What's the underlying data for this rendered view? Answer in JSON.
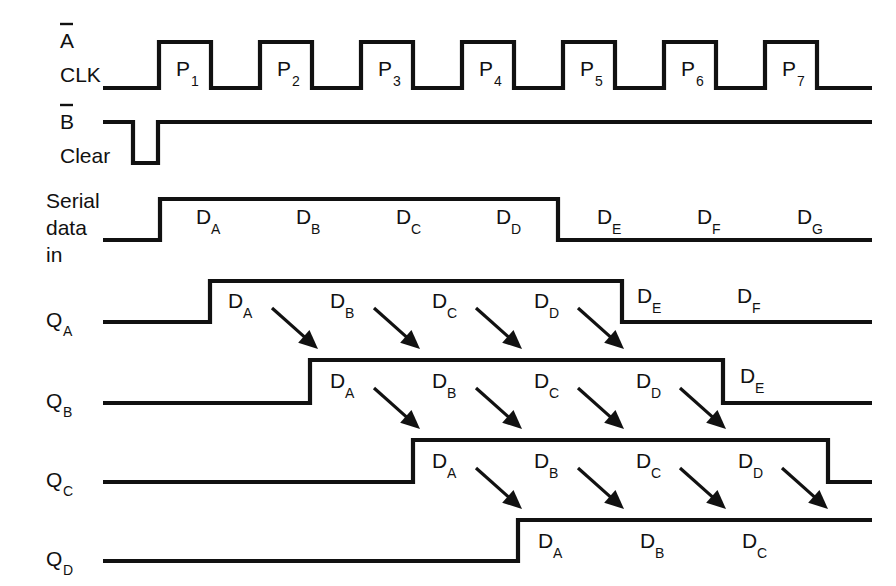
{
  "figure": {
    "type": "timing-diagram",
    "line_color": "#111111",
    "background": "#ffffff",
    "width": 896,
    "height": 586
  },
  "geometry": {
    "clock_first_rise_x": 159,
    "clock_pulse_width": 52,
    "clock_period": 101,
    "wave_start_x": 103,
    "wave_end_x": 872
  },
  "rows": [
    {
      "id": "clk",
      "name": "A CLK",
      "label_lines": [
        "A",
        "CLK"
      ],
      "label_overbar_line": 0,
      "y_high": 42,
      "y_low": 88,
      "kind": "clock",
      "pulses": [
        {
          "label": "P",
          "sub": "1",
          "rise": 159,
          "fall": 211
        },
        {
          "label": "P",
          "sub": "2",
          "rise": 260,
          "fall": 312
        },
        {
          "label": "P",
          "sub": "3",
          "rise": 361,
          "fall": 413
        },
        {
          "label": "P",
          "sub": "4",
          "rise": 462,
          "fall": 514
        },
        {
          "label": "P",
          "sub": "5",
          "rise": 563,
          "fall": 615
        },
        {
          "label": "P",
          "sub": "6",
          "rise": 664,
          "fall": 716
        },
        {
          "label": "P",
          "sub": "7",
          "rise": 765,
          "fall": 817
        }
      ]
    },
    {
      "id": "clear",
      "name": "B Clear",
      "label_lines": [
        "B",
        "Clear"
      ],
      "label_overbar_line": 0,
      "y_high": 122,
      "y_low": 163,
      "kind": "active-low-pulse",
      "low_start": 133,
      "low_end": 158,
      "data_labels": []
    },
    {
      "id": "serial-data-in",
      "name": "Serial data in",
      "label_lines": [
        "Serial",
        "data",
        "in"
      ],
      "label_overbar_line": -1,
      "y_high": 199,
      "y_low": 240,
      "kind": "data",
      "rise": 160,
      "fall": 558,
      "data_labels": [
        {
          "label": "D",
          "sub": "A",
          "x": 196,
          "y": 224
        },
        {
          "label": "D",
          "sub": "B",
          "x": 296,
          "y": 224
        },
        {
          "label": "D",
          "sub": "C",
          "x": 396,
          "y": 224
        },
        {
          "label": "D",
          "sub": "D",
          "x": 496,
          "y": 224
        },
        {
          "label": "D",
          "sub": "E",
          "x": 597,
          "y": 224
        },
        {
          "label": "D",
          "sub": "F",
          "x": 697,
          "y": 224
        },
        {
          "label": "D",
          "sub": "G",
          "x": 797,
          "y": 224
        }
      ]
    },
    {
      "id": "qa",
      "name": "QA",
      "label_lines": [
        "Q"
      ],
      "label_sub": "A",
      "label_overbar_line": -1,
      "y_high": 281,
      "y_low": 322,
      "kind": "data",
      "rise": 210,
      "fall": 622,
      "data_labels": [
        {
          "label": "D",
          "sub": "A",
          "x": 228,
          "y": 308
        },
        {
          "label": "D",
          "sub": "B",
          "x": 330,
          "y": 308
        },
        {
          "label": "D",
          "sub": "C",
          "x": 432,
          "y": 308
        },
        {
          "label": "D",
          "sub": "D",
          "x": 534,
          "y": 308
        },
        {
          "label": "D",
          "sub": "E",
          "x": 637,
          "y": 303
        },
        {
          "label": "D",
          "sub": "F",
          "x": 737,
          "y": 303
        }
      ],
      "arrows": [
        {
          "x1": 272,
          "y1": 308,
          "x2": 318,
          "y2": 349
        },
        {
          "x1": 374,
          "y1": 308,
          "x2": 420,
          "y2": 349
        },
        {
          "x1": 476,
          "y1": 308,
          "x2": 522,
          "y2": 349
        },
        {
          "x1": 578,
          "y1": 308,
          "x2": 624,
          "y2": 349
        }
      ]
    },
    {
      "id": "qb",
      "name": "QB",
      "label_lines": [
        "Q"
      ],
      "label_sub": "B",
      "label_overbar_line": -1,
      "y_high": 360,
      "y_low": 403,
      "kind": "data",
      "rise": 310,
      "fall": 723,
      "data_labels": [
        {
          "label": "D",
          "sub": "A",
          "x": 330,
          "y": 388
        },
        {
          "label": "D",
          "sub": "B",
          "x": 432,
          "y": 388
        },
        {
          "label": "D",
          "sub": "C",
          "x": 534,
          "y": 388
        },
        {
          "label": "D",
          "sub": "D",
          "x": 636,
          "y": 388
        },
        {
          "label": "D",
          "sub": "E",
          "x": 740,
          "y": 383
        }
      ],
      "arrows": [
        {
          "x1": 374,
          "y1": 388,
          "x2": 420,
          "y2": 429
        },
        {
          "x1": 476,
          "y1": 388,
          "x2": 522,
          "y2": 429
        },
        {
          "x1": 578,
          "y1": 388,
          "x2": 624,
          "y2": 429
        },
        {
          "x1": 680,
          "y1": 388,
          "x2": 726,
          "y2": 429
        }
      ]
    },
    {
      "id": "qc",
      "name": "QC",
      "label_lines": [
        "Q"
      ],
      "label_sub": "C",
      "label_overbar_line": -1,
      "y_high": 440,
      "y_low": 482,
      "kind": "data",
      "rise": 413,
      "fall": 828,
      "data_labels": [
        {
          "label": "D",
          "sub": "A",
          "x": 432,
          "y": 468
        },
        {
          "label": "D",
          "sub": "B",
          "x": 534,
          "y": 468
        },
        {
          "label": "D",
          "sub": "C",
          "x": 636,
          "y": 468
        },
        {
          "label": "D",
          "sub": "D",
          "x": 738,
          "y": 468
        }
      ],
      "arrows": [
        {
          "x1": 476,
          "y1": 468,
          "x2": 522,
          "y2": 509
        },
        {
          "x1": 578,
          "y1": 468,
          "x2": 624,
          "y2": 509
        },
        {
          "x1": 680,
          "y1": 468,
          "x2": 726,
          "y2": 509
        },
        {
          "x1": 782,
          "y1": 468,
          "x2": 828,
          "y2": 509
        }
      ]
    },
    {
      "id": "qd",
      "name": "QD",
      "label_lines": [
        "Q"
      ],
      "label_sub": "D",
      "label_overbar_line": -1,
      "y_high": 520,
      "y_low": 561,
      "kind": "data",
      "rise": 518,
      "fall": null,
      "data_labels": [
        {
          "label": "D",
          "sub": "A",
          "x": 538,
          "y": 548
        },
        {
          "label": "D",
          "sub": "B",
          "x": 640,
          "y": 548
        },
        {
          "label": "D",
          "sub": "C",
          "x": 742,
          "y": 548
        }
      ],
      "arrows": []
    }
  ],
  "row_label_positions": [
    {
      "id": "clk",
      "x": 60,
      "lines": [
        {
          "text": "A",
          "y": 48,
          "overbar": true
        },
        {
          "text": "CLK",
          "y": 82,
          "overbar": false
        }
      ]
    },
    {
      "id": "clear",
      "x": 60,
      "lines": [
        {
          "text": "B",
          "y": 129,
          "overbar": true
        },
        {
          "text": "Clear",
          "y": 163,
          "overbar": false
        }
      ]
    },
    {
      "id": "serial",
      "x": 46,
      "lines": [
        {
          "text": "Serial",
          "y": 208,
          "overbar": false
        },
        {
          "text": "data",
          "y": 235,
          "overbar": false
        },
        {
          "text": "in",
          "y": 262,
          "overbar": false
        }
      ]
    },
    {
      "id": "qa",
      "x": 46,
      "lines": [
        {
          "text": "Q",
          "y": 327,
          "overbar": false
        }
      ]
    },
    {
      "id": "qb",
      "x": 46,
      "lines": [
        {
          "text": "Q",
          "y": 408,
          "overbar": false
        }
      ]
    },
    {
      "id": "qc",
      "x": 46,
      "lines": [
        {
          "text": "Q",
          "y": 487,
          "overbar": false
        }
      ]
    },
    {
      "id": "qd",
      "x": 46,
      "lines": [
        {
          "text": "Q",
          "y": 566,
          "overbar": false
        }
      ]
    }
  ]
}
